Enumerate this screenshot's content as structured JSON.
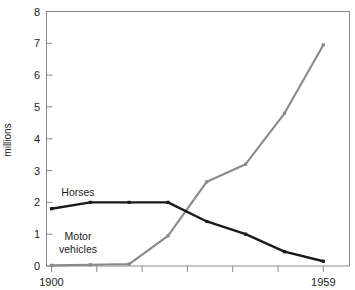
{
  "chart_data": {
    "type": "line",
    "title": "",
    "subtitle": "",
    "xlabel": "",
    "ylabel": "millions",
    "xlim": [
      1900,
      1959
    ],
    "ylim": [
      0,
      8
    ],
    "grid": false,
    "legend_position": "inline-annotations",
    "x": [
      1900,
      1908,
      1917,
      1925,
      1934,
      1942,
      1951,
      1959
    ],
    "xtick_labels": [
      "1900",
      "",
      "",
      "",
      "",
      "",
      "",
      "1959"
    ],
    "ytick_labels": [
      "0",
      "1",
      "2",
      "3",
      "4",
      "5",
      "6",
      "7",
      "8"
    ],
    "ytick_values": [
      0,
      1,
      2,
      3,
      4,
      5,
      6,
      7,
      8
    ],
    "series": [
      {
        "name": "Horses",
        "color": "#1a1a1a",
        "values": [
          1.8,
          2.0,
          2.0,
          2.0,
          1.4,
          1.0,
          0.45,
          0.15
        ],
        "label_text": "Horses"
      },
      {
        "name": "Motor vehicles",
        "color": "#8a8a8a",
        "values": [
          0.02,
          0.04,
          0.06,
          0.95,
          2.65,
          3.2,
          4.8,
          6.95
        ],
        "label_text_line1": "Motor",
        "label_text_line2": "vehicles"
      }
    ],
    "annotations": [
      {
        "text": "Horses",
        "x_px": 78,
        "y_px": 196
      },
      {
        "text": "Motor",
        "x_px": 78,
        "y_px": 240
      },
      {
        "text": "vehicles",
        "x_px": 78,
        "y_px": 253
      }
    ]
  },
  "axis": {
    "y_title": "millions",
    "y_ticks": [
      "8",
      "7",
      "6",
      "5",
      "4",
      "3",
      "2",
      "1",
      "0"
    ],
    "x_tick_left": "1900",
    "x_tick_right": "1959"
  }
}
